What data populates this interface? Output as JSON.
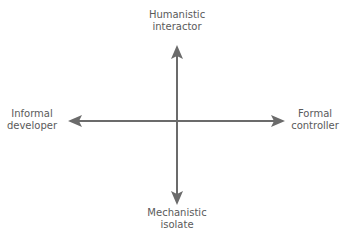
{
  "diagram": {
    "type": "quadrant-axes",
    "colors": {
      "axis": "#6b6b6b",
      "text": "#5a5a5a"
    },
    "labels": {
      "top": {
        "line1": "Humanistic",
        "line2": "interactor"
      },
      "bottom": {
        "line1": "Mechanistic",
        "line2": "isolate"
      },
      "left": {
        "line1": "Informal",
        "line2": "developer"
      },
      "right": {
        "line1": "Formal",
        "line2": "controller"
      }
    }
  }
}
